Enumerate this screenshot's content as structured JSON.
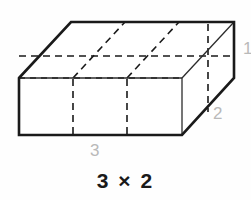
{
  "figure": {
    "type": "rectangular-prism-oblique",
    "caption": "3 × 2",
    "colors": {
      "background": "#fefefe",
      "outline": "#1a1a1a",
      "hidden_line": "#1a1a1a",
      "interior_line": "#3a3a3a",
      "dimension_label": "#b9b9b9",
      "caption": "#1a1a1a"
    },
    "dimension_labels": {
      "length": "3",
      "width": "2",
      "height": "1"
    },
    "geometry": {
      "front_face": {
        "top_left": [
          19,
          78
        ],
        "top_right": [
          182,
          78
        ],
        "bottom_right": [
          182,
          135
        ],
        "bottom_left": [
          19,
          135
        ]
      },
      "depth_offset": [
        52,
        -56
      ],
      "back_top_left": [
        71,
        22
      ],
      "back_top_right": [
        234,
        22
      ],
      "back_bottom_right": [
        234,
        78
      ],
      "back_bottom_left": [
        71,
        79
      ],
      "front_divisions_x": [
        73,
        127
      ],
      "top_division_points": [
        [
          73,
          78
        ],
        [
          125,
          22
        ]
      ],
      "top_division_points_2": [
        [
          127,
          78
        ],
        [
          179,
          22
        ]
      ],
      "hidden_vertical_right_x": 208,
      "hidden_vertical_right_y": [
        23,
        79
      ]
    }
  }
}
